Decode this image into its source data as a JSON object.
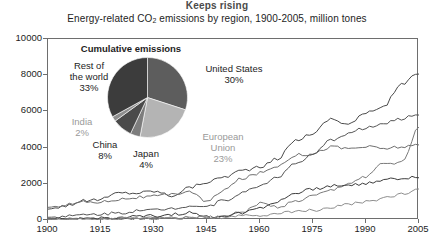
{
  "header": {
    "kicker": "Keeps rising",
    "subtitle_pre": "Energy-related CO",
    "subtitle_sub": "2",
    "subtitle_post": " emissions by region, 1900-2005, million tones"
  },
  "pie": {
    "title": "Cumulative emissions",
    "slices": [
      {
        "name": "United States",
        "label": "United States",
        "value": 30,
        "pct_label": "30%",
        "color": "#5d5d5d",
        "label_color": "#1d1d1d"
      },
      {
        "name": "European Union",
        "label": "European Union",
        "value": 23,
        "pct_label": "23%",
        "color": "#b4b4b4",
        "label_color": "#9a9a9a"
      },
      {
        "name": "Japan",
        "label": "Japan",
        "value": 4,
        "pct_label": "4%",
        "color": "#7d7d7d",
        "label_color": "#1d1d1d"
      },
      {
        "name": "China",
        "label": "China",
        "value": 8,
        "pct_label": "8%",
        "color": "#4a4a4a",
        "label_color": "#1d1d1d"
      },
      {
        "name": "India",
        "label": "India",
        "value": 2,
        "pct_label": "2%",
        "color": "#8e8e8e",
        "label_color": "#9a9a9a"
      },
      {
        "name": "Rest of the world",
        "label": "Rest of the world",
        "value": 33,
        "pct_label": "33%",
        "color": "#3c3c3c",
        "label_color": "#1d1d1d"
      }
    ],
    "labels": {
      "rest_line1": "Rest of",
      "rest_line2": "the world",
      "rest_pct": "33%",
      "us_line1": "United States",
      "us_pct": "30%",
      "eu_line1": "European",
      "eu_line2": "Union",
      "eu_pct": "23%",
      "india": "India",
      "india_pct": "2%",
      "china": "China",
      "china_pct": "8%",
      "japan": "Japan",
      "japan_pct": "4%"
    }
  },
  "chart_data": {
    "type": "line",
    "title": "Keeps rising",
    "subtitle": "Energy-related CO2 emissions by region, 1900-2005, million tones",
    "xlabel": "",
    "ylabel": "million tones",
    "xlim": [
      1900,
      2005
    ],
    "ylim": [
      0,
      10000
    ],
    "xticks": [
      1900,
      1915,
      1930,
      1945,
      1960,
      1975,
      1990,
      2005
    ],
    "yticks": [
      0,
      2000,
      4000,
      6000,
      8000,
      10000
    ],
    "grid": false,
    "legend": "none",
    "x": [
      1900,
      1905,
      1910,
      1915,
      1920,
      1925,
      1930,
      1935,
      1940,
      1945,
      1950,
      1955,
      1960,
      1965,
      1970,
      1975,
      1980,
      1985,
      1990,
      1995,
      2000,
      2005
    ],
    "series": [
      {
        "name": "United States",
        "color": "#4a4a4a",
        "values": [
          600,
          800,
          1050,
          1150,
          1500,
          1500,
          1600,
          1350,
          1800,
          2100,
          2400,
          2750,
          2900,
          3400,
          4400,
          4800,
          5600,
          5300,
          5900,
          6300,
          7500,
          8100
        ]
      },
      {
        "name": "European Union",
        "color": "#6e6e6e",
        "values": [
          700,
          850,
          1000,
          1000,
          1150,
          1250,
          1300,
          1400,
          1600,
          1000,
          1700,
          2300,
          2600,
          3000,
          3600,
          3650,
          4050,
          3950,
          4050,
          3950,
          4050,
          4100
        ]
      },
      {
        "name": "Rest of the world",
        "color": "#555555",
        "values": [
          150,
          200,
          280,
          330,
          400,
          480,
          550,
          650,
          800,
          750,
          1100,
          1500,
          1900,
          2400,
          3100,
          3600,
          4400,
          4800,
          5100,
          5300,
          5600,
          5850
        ]
      },
      {
        "name": "China",
        "color": "#7a7a7a",
        "values": [
          20,
          30,
          40,
          50,
          60,
          80,
          100,
          130,
          180,
          150,
          200,
          450,
          900,
          700,
          1000,
          1300,
          1600,
          2000,
          2400,
          3100,
          3200,
          5100
        ]
      },
      {
        "name": "Japan",
        "color": "#3c3c3c",
        "values": [
          30,
          50,
          80,
          100,
          130,
          170,
          220,
          300,
          400,
          150,
          250,
          400,
          700,
          1000,
          1500,
          1700,
          1900,
          1900,
          2050,
          2200,
          2300,
          2400
        ]
      },
      {
        "name": "India",
        "color": "#8e8e8e",
        "values": [
          20,
          25,
          35,
          45,
          55,
          70,
          85,
          100,
          120,
          130,
          150,
          200,
          280,
          350,
          450,
          550,
          700,
          850,
          1000,
          1200,
          1400,
          1700
        ]
      }
    ]
  },
  "axis": {
    "yticks": [
      {
        "value": 10000,
        "label": "10000"
      },
      {
        "value": 8000,
        "label": "8000"
      },
      {
        "value": 6000,
        "label": "6000"
      },
      {
        "value": 4000,
        "label": "4000"
      },
      {
        "value": 2000,
        "label": "2000"
      },
      {
        "value": 0,
        "label": "0"
      }
    ],
    "xticks": [
      {
        "value": 1900,
        "label": "1900"
      },
      {
        "value": 1915,
        "label": "1915"
      },
      {
        "value": 1930,
        "label": "1930"
      },
      {
        "value": 1945,
        "label": "1945"
      },
      {
        "value": 1960,
        "label": "1960"
      },
      {
        "value": 1975,
        "label": "1975"
      },
      {
        "value": 1990,
        "label": "1990"
      },
      {
        "value": 2005,
        "label": "2005"
      }
    ]
  }
}
